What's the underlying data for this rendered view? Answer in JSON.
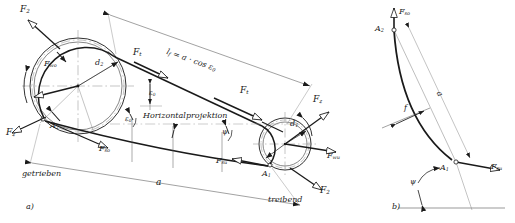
{
  "figure": {
    "domain_title": "Riementrieb Kraefteplan",
    "panels": [
      {
        "key": "a",
        "caption": "a)"
      },
      {
        "key": "b",
        "caption": "b)"
      }
    ]
  },
  "colors": {
    "line": "#1a1a1a",
    "thin": "#555555",
    "center": "#777777",
    "background": "#ffffff"
  },
  "panel_a": {
    "caption": "a)",
    "driven_label": "getrieben",
    "driving_label": "treibend",
    "horizontal_projection_label": "Horizontalprojektion",
    "span_label": "a",
    "free_length_label": "l",
    "free_length_sub": "f",
    "free_length_expr": "= a · cos ε",
    "free_length_expr_sub": "0",
    "large_pulley": {
      "diameter_label": "d",
      "diameter_sub": "2",
      "attachment_point": "A",
      "attachment_sub": "2",
      "forces": [
        {
          "name": "F",
          "sub": "2",
          "position": "top-left"
        },
        {
          "name": "F",
          "sub": "wo",
          "position": "left-inner"
        },
        {
          "name": "F",
          "sub": "z",
          "position": "bottom-left"
        },
        {
          "name": "F",
          "sub": "so",
          "position": "lower-right"
        }
      ]
    },
    "small_pulley": {
      "diameter_label": "d",
      "diameter_sub": "1",
      "attachment_point": "A",
      "attachment_sub": "1",
      "forces": [
        {
          "name": "F",
          "sub": "t",
          "position": "upper-left"
        },
        {
          "name": "F",
          "sub": "z",
          "position": "upper-right"
        },
        {
          "name": "F",
          "sub": "wu",
          "position": "right"
        },
        {
          "name": "F",
          "sub": "2",
          "position": "lower-right"
        },
        {
          "name": "F",
          "sub": "su",
          "position": "left-lower"
        }
      ]
    },
    "belt_forces": [
      {
        "name": "F",
        "sub": "t",
        "position": "upper-span"
      },
      {
        "name": "F",
        "sub": "t",
        "position": "mid-span"
      }
    ],
    "angles": [
      {
        "symbol": "ε",
        "sub": "0",
        "position": "center-right-of-large-pulley"
      },
      {
        "symbol": "ε",
        "sub": "0",
        "position": "upper-span"
      },
      {
        "symbol": "ψ",
        "sub": "",
        "position": "lower-span"
      }
    ]
  },
  "panel_b": {
    "caption": "b)",
    "top_force": {
      "name": "F",
      "sub": "so"
    },
    "bottom_force": {
      "name": "F",
      "sub": "su"
    },
    "top_point": {
      "name": "A",
      "sub": "2"
    },
    "bottom_point": {
      "name": "A",
      "sub": "1"
    },
    "sag_label": "f",
    "chord_label": "a",
    "angle_label": "ψ"
  }
}
